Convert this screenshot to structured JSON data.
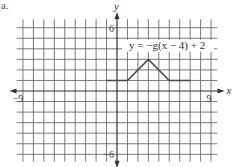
{
  "corner_mark": "a.",
  "chart_data": {
    "type": "line",
    "title": "",
    "xlabel": "x",
    "ylabel": "y",
    "xlim": [
      -9,
      9
    ],
    "ylim": [
      -6,
      6
    ],
    "grid": true,
    "grid_step": 1,
    "x_tick_labels": [
      {
        "value": -9,
        "label": "−9"
      },
      {
        "value": 9,
        "label": "9"
      }
    ],
    "y_tick_labels": [
      {
        "value": 6,
        "label": "6"
      },
      {
        "value": -6,
        "label": "−6"
      }
    ],
    "series": [
      {
        "name": "y = −g(x − 4) + 2",
        "points": [
          [
            -1,
            1
          ],
          [
            1,
            1
          ],
          [
            3,
            3
          ],
          [
            5,
            1
          ],
          [
            7,
            1
          ]
        ]
      }
    ],
    "annotations": [
      {
        "text": "y = −g(x − 4) + 2",
        "x": 4.8,
        "y": 4.0
      }
    ],
    "colors": {
      "grid": "#6b6b6b",
      "axis": "#333333",
      "curve": "#4a4a4a"
    }
  }
}
